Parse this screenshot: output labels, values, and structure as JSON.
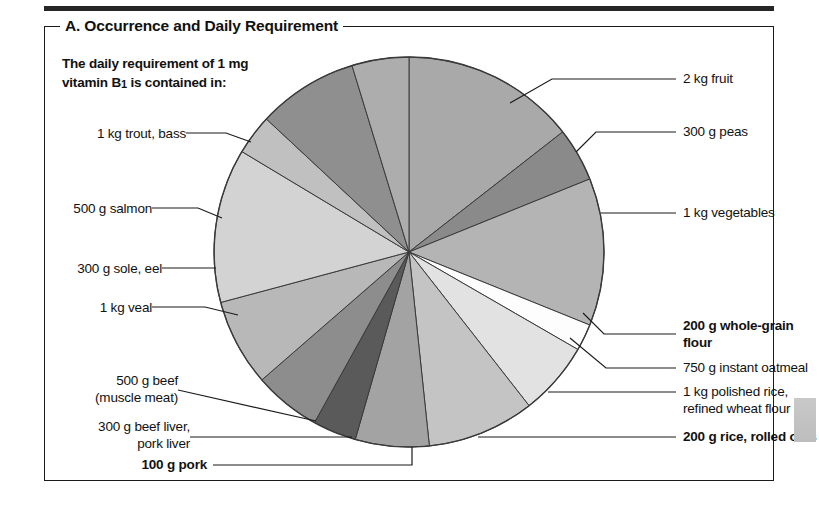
{
  "panel": {
    "title": "A. Occurrence and Daily Requirement",
    "intro_line1": "The daily requirement of 1 mg",
    "intro_line2_pre": "vitamin B",
    "intro_line2_sub": "1",
    "intro_line2_post": " is contained in:"
  },
  "labels": {
    "fruit": "2 kg fruit",
    "peas": "300 g peas",
    "vegetables": "1 kg vegetables",
    "whole_grain_l1": "200 g whole-grain",
    "whole_grain_l2": "flour",
    "oatmeal": "750 g instant oatmeal",
    "polished_rice_l1": "1 kg polished rice,",
    "polished_rice_l2": "refined wheat flour",
    "rice_rolled_oats": "200 g rice, rolled oats",
    "pork": "100 g pork",
    "beef_liver_l1": "300 g beef liver,",
    "beef_liver_l2": "pork liver",
    "beef_l1": "500 g beef",
    "beef_l2": "(muscle meat)",
    "veal": "1 kg veal",
    "sole_eel": "300 g sole, eel",
    "salmon": "500 g salmon",
    "trout_bass": "1 kg trout, bass"
  },
  "chart_data": {
    "type": "pie",
    "title": "A. Occurrence and Daily Requirement",
    "subtitle": "The daily requirement of 1 mg vitamin B1 is contained in:",
    "legend_position": "callout-labels",
    "center": {
      "x": 409,
      "y": 252
    },
    "radius": 195,
    "units": "degrees of arc",
    "total_degrees": 360,
    "categories": [
      "2 kg fruit",
      "300 g peas",
      "1 kg vegetables",
      "200 g whole-grain flour",
      "750 g instant oatmeal",
      "1 kg polished rice, refined wheat flour",
      "200 g rice, rolled oats",
      "100 g pork",
      "300 g beef liver, pork liver",
      "500 g beef (muscle meat)",
      "1 kg veal",
      "300 g sole, eel",
      "500 g salmon",
      "1 kg trout, bass"
    ],
    "values": [
      52,
      16,
      44,
      8,
      22,
      32,
      22,
      13,
      20,
      26,
      46,
      12,
      30,
      17
    ],
    "colors": [
      "#a9a9a9",
      "#8a8a8a",
      "#b4b4b4",
      "#fdfdfd",
      "#e2e2e2",
      "#c4c4c4",
      "#a3a3a3",
      "#5a5a5a",
      "#8d8d8d",
      "#b8b8b8",
      "#d3d3d3",
      "#c0c0c0",
      "#8f8f8f",
      "#adadad"
    ],
    "start_angle_deg": -90,
    "stroke": "#3a3a3a",
    "stroke_width": 1
  },
  "colors": {
    "frame": "#1b1b1b",
    "text": "#111111",
    "rule": "#262626",
    "thumb": "#c4c4c4"
  }
}
